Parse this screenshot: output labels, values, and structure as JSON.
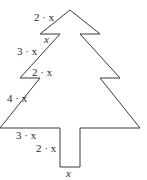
{
  "diagram": {
    "stroke_color": "#3a3a3a",
    "labels": {
      "top_slant": "2 · x",
      "tier1_step": "x",
      "tier2_slant": "3 · x",
      "tier2_step": "2 · x",
      "tier3_slant": "4 · x",
      "tier3_step": "3 · x",
      "trunk_height": "2 · x",
      "trunk_width": "x"
    }
  }
}
